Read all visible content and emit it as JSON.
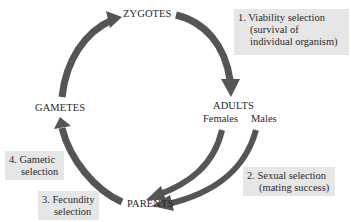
{
  "diagram": {
    "type": "life-cycle",
    "stages": {
      "zygotes": "ZYGOTES",
      "adults": "ADULTS",
      "females": "Females",
      "males": "Males",
      "parents": "PARENTS",
      "gametes": "GAMETES"
    },
    "selection_boxes": [
      {
        "number": "1.",
        "lines": [
          "Viability selection",
          "(survival of",
          "individual organism)"
        ]
      },
      {
        "number": "2.",
        "lines": [
          "Sexual selection",
          "(mating success)"
        ]
      },
      {
        "number": "3.",
        "lines": [
          "Fecundity",
          "selection"
        ]
      },
      {
        "number": "4.",
        "lines": [
          "Gametic",
          "selection"
        ]
      }
    ],
    "colors": {
      "arrow": "#555555",
      "box_background": "#e6e6e6",
      "text": "#2a2a2a"
    }
  }
}
